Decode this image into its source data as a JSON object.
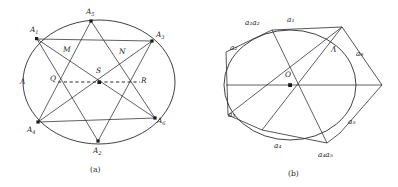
{
  "figure": {
    "background": "#ffffff",
    "ink": "#2b2b2b",
    "panel_a": {
      "caption": "(a)",
      "region_label": "Λ",
      "vertex_labels": [
        {
          "id": "A1",
          "base": "A",
          "sub": "1"
        },
        {
          "id": "A2",
          "base": "A",
          "sub": "2"
        },
        {
          "id": "A3",
          "base": "A",
          "sub": "3"
        },
        {
          "id": "A4",
          "base": "A",
          "sub": "4"
        },
        {
          "id": "A5",
          "base": "A",
          "sub": "5"
        },
        {
          "id": "A6",
          "base": "A",
          "sub": "6"
        }
      ],
      "interior_labels": [
        "M",
        "N",
        "Q",
        "S",
        "R"
      ],
      "dashed_segment": "Q–S–R"
    },
    "panel_b": {
      "caption": "(b)",
      "region_label": "Λ̄",
      "center_label": "O",
      "arc_labels": [
        {
          "id": "a1a2_left",
          "text": "a₁a₂"
        },
        {
          "id": "a1_top",
          "text": "a₁"
        },
        {
          "id": "a2_left",
          "text": "a₂"
        },
        {
          "id": "a3_left",
          "text": "a₃"
        },
        {
          "id": "a4_bottom",
          "text": "a₄"
        },
        {
          "id": "a4a5_bottom",
          "text": "a₄a₅"
        },
        {
          "id": "a5_right",
          "text": "a₅"
        },
        {
          "id": "a6_right",
          "text": "a₆"
        }
      ]
    }
  }
}
